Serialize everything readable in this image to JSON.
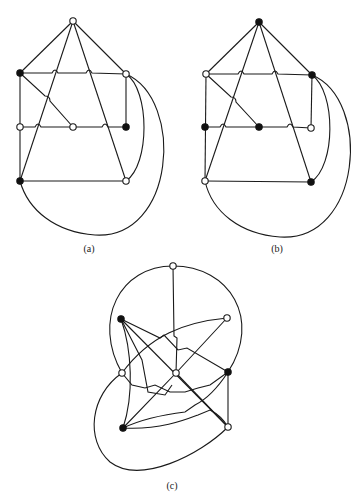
{
  "figure": {
    "panels": [
      {
        "id": "a",
        "caption": "(a)",
        "nodes": [
          {
            "name": "top",
            "x": 73,
            "y": 21,
            "color": "white"
          },
          {
            "name": "upper-left",
            "x": 20,
            "y": 73,
            "color": "black"
          },
          {
            "name": "upper-right",
            "x": 126,
            "y": 74,
            "color": "white"
          },
          {
            "name": "middle-left",
            "x": 20,
            "y": 127,
            "color": "white"
          },
          {
            "name": "middle-center",
            "x": 73,
            "y": 127,
            "color": "white"
          },
          {
            "name": "middle-right",
            "x": 126,
            "y": 127,
            "color": "black"
          },
          {
            "name": "bottom-left",
            "x": 20,
            "y": 181,
            "color": "black"
          },
          {
            "name": "bottom-right",
            "x": 126,
            "y": 181,
            "color": "white"
          }
        ]
      },
      {
        "id": "b",
        "caption": "(b)",
        "nodes": [
          {
            "name": "top",
            "x": 259,
            "y": 22,
            "color": "black"
          },
          {
            "name": "upper-left",
            "x": 206,
            "y": 74,
            "color": "white"
          },
          {
            "name": "upper-right",
            "x": 312,
            "y": 75,
            "color": "black"
          },
          {
            "name": "middle-left",
            "x": 205,
            "y": 127,
            "color": "black"
          },
          {
            "name": "middle-center",
            "x": 259,
            "y": 127,
            "color": "black"
          },
          {
            "name": "middle-right",
            "x": 311,
            "y": 128,
            "color": "white"
          },
          {
            "name": "bottom-left",
            "x": 205,
            "y": 181,
            "color": "white"
          },
          {
            "name": "bottom-right",
            "x": 311,
            "y": 182,
            "color": "black"
          }
        ]
      },
      {
        "id": "c",
        "caption": "(c)",
        "nodes": [
          {
            "name": "top",
            "x": 173,
            "y": 266,
            "color": "white"
          },
          {
            "name": "upper-left",
            "x": 121,
            "y": 319,
            "color": "black"
          },
          {
            "name": "upper-right",
            "x": 227,
            "y": 318,
            "color": "white"
          },
          {
            "name": "middle-left",
            "x": 122,
            "y": 373,
            "color": "white"
          },
          {
            "name": "center",
            "x": 176,
            "y": 373,
            "color": "white"
          },
          {
            "name": "middle-right",
            "x": 228,
            "y": 372,
            "color": "black"
          },
          {
            "name": "bottom-left",
            "x": 123,
            "y": 428,
            "color": "black"
          },
          {
            "name": "bottom-right",
            "x": 228,
            "y": 427,
            "color": "white"
          }
        ]
      }
    ],
    "colors": {
      "stroke": "#1a1a1a",
      "black_node": "#111111",
      "white_node": "#ffffff",
      "background": "#ffffff"
    }
  }
}
